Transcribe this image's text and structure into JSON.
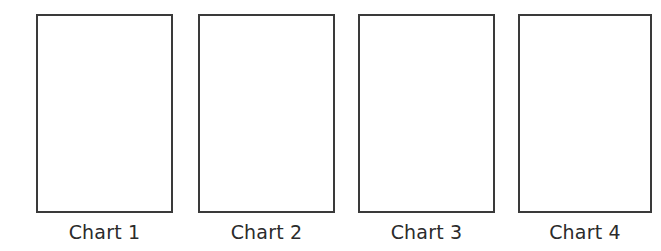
{
  "page": {
    "background_color": "#ffffff",
    "width": 661,
    "height": 251
  },
  "chart_data": {
    "type": "table",
    "title": "",
    "subtitle": "",
    "xlabel": "",
    "ylabel": "",
    "grid": false,
    "legend": "none",
    "note": "Four empty rectangular chart placeholder frames arranged left to right in a single row, each with a caption beneath it. No plotted data, axes, ticks, or legend entries are rendered inside the frames.",
    "categories": [
      "Chart 1",
      "Chart 2",
      "Chart 3",
      "Chart 4"
    ],
    "values": [
      null,
      null,
      null,
      null
    ]
  },
  "charts": [
    {
      "label": "Chart 1",
      "frame": {
        "border_color": "#3a3a3a",
        "border_width": 2,
        "fill_color": "#ffffff",
        "content": ""
      }
    },
    {
      "label": "Chart 2",
      "frame": {
        "border_color": "#3a3a3a",
        "border_width": 2,
        "fill_color": "#ffffff",
        "content": ""
      }
    },
    {
      "label": "Chart 3",
      "frame": {
        "border_color": "#3a3a3a",
        "border_width": 2,
        "fill_color": "#ffffff",
        "content": ""
      }
    },
    {
      "label": "Chart 4",
      "frame": {
        "border_color": "#3a3a3a",
        "border_width": 2,
        "fill_color": "#ffffff",
        "content": ""
      }
    }
  ]
}
